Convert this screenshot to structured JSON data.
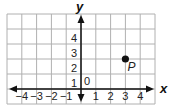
{
  "chart_data": {
    "type": "scatter",
    "title": "",
    "xlabel": "x",
    "ylabel": "y",
    "xlim": [
      -5,
      5
    ],
    "ylim": [
      -1,
      5
    ],
    "grid": true,
    "x_ticks": [
      -4,
      -3,
      -2,
      -1,
      1,
      2,
      3,
      4
    ],
    "x_tick_labels": [
      "−4",
      "−3",
      "−2",
      "−1",
      "1",
      "2",
      "3",
      "4"
    ],
    "y_ticks": [
      1,
      2,
      3,
      4
    ],
    "y_tick_labels": [
      "1",
      "2",
      "3",
      "4"
    ],
    "origin_label": "0",
    "points": [
      {
        "label": "P",
        "x": 3,
        "y": 2
      }
    ]
  },
  "colors": {
    "grid": "#b0b0b0",
    "axis": "#111111",
    "point": "#111111"
  }
}
